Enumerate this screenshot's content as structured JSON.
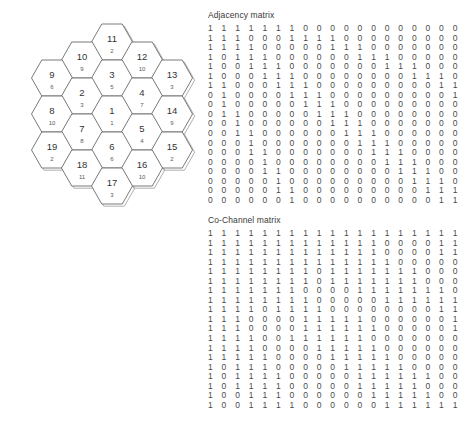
{
  "hex_map": {
    "name": "cellular-hexagon-cluster",
    "cells": [
      {
        "id": "11",
        "sub": "2",
        "cx": 112,
        "cy": 42
      },
      {
        "id": "10",
        "sub": "9",
        "cx": 82,
        "cy": 60
      },
      {
        "id": "12",
        "sub": "10",
        "cx": 142,
        "cy": 60
      },
      {
        "id": "9",
        "sub": "6",
        "cx": 52,
        "cy": 78
      },
      {
        "id": "3",
        "sub": "5",
        "cx": 112,
        "cy": 78
      },
      {
        "id": "13",
        "sub": "3",
        "cx": 172,
        "cy": 78
      },
      {
        "id": "2",
        "sub": "3",
        "cx": 82,
        "cy": 96
      },
      {
        "id": "4",
        "sub": "7",
        "cx": 142,
        "cy": 96
      },
      {
        "id": "8",
        "sub": "10",
        "cx": 52,
        "cy": 114
      },
      {
        "id": "1",
        "sub": "1",
        "cx": 112,
        "cy": 114
      },
      {
        "id": "14",
        "sub": "9",
        "cx": 172,
        "cy": 114
      },
      {
        "id": "7",
        "sub": "8",
        "cx": 82,
        "cy": 132
      },
      {
        "id": "5",
        "sub": "4",
        "cx": 142,
        "cy": 132
      },
      {
        "id": "19",
        "sub": "2",
        "cx": 52,
        "cy": 150
      },
      {
        "id": "6",
        "sub": "6",
        "cx": 112,
        "cy": 150
      },
      {
        "id": "15",
        "sub": "2",
        "cx": 172,
        "cy": 150
      },
      {
        "id": "18",
        "sub": "11",
        "cx": 82,
        "cy": 168
      },
      {
        "id": "16",
        "sub": "10",
        "cx": 142,
        "cy": 168
      },
      {
        "id": "17",
        "sub": "3",
        "cx": 112,
        "cy": 186
      }
    ]
  },
  "adjacency": {
    "title": "Adjacency matrix",
    "rows": [
      [
        1,
        1,
        1,
        1,
        1,
        1,
        1,
        0,
        0,
        0,
        0,
        0,
        0,
        0,
        0,
        0,
        0,
        0,
        0
      ],
      [
        1,
        1,
        1,
        0,
        0,
        0,
        1,
        1,
        1,
        1,
        0,
        0,
        0,
        0,
        0,
        0,
        0,
        0,
        0
      ],
      [
        1,
        1,
        1,
        1,
        0,
        0,
        0,
        0,
        0,
        1,
        1,
        1,
        0,
        0,
        0,
        0,
        0,
        0,
        0
      ],
      [
        1,
        0,
        1,
        1,
        1,
        0,
        0,
        0,
        0,
        0,
        0,
        1,
        1,
        1,
        0,
        0,
        0,
        0,
        0
      ],
      [
        1,
        0,
        0,
        1,
        1,
        1,
        0,
        0,
        0,
        0,
        0,
        0,
        0,
        1,
        1,
        1,
        0,
        0,
        0
      ],
      [
        1,
        0,
        0,
        0,
        1,
        1,
        1,
        0,
        0,
        0,
        0,
        0,
        0,
        0,
        0,
        1,
        1,
        1,
        0
      ],
      [
        1,
        1,
        0,
        0,
        0,
        1,
        1,
        1,
        0,
        0,
        0,
        0,
        0,
        0,
        0,
        0,
        0,
        1,
        1
      ],
      [
        0,
        1,
        0,
        0,
        0,
        0,
        1,
        1,
        1,
        0,
        0,
        0,
        0,
        0,
        0,
        0,
        0,
        0,
        1
      ],
      [
        0,
        1,
        0,
        0,
        0,
        0,
        0,
        1,
        1,
        1,
        0,
        0,
        0,
        0,
        0,
        0,
        0,
        0,
        0
      ],
      [
        0,
        1,
        1,
        0,
        0,
        0,
        0,
        0,
        1,
        1,
        1,
        0,
        0,
        0,
        0,
        0,
        0,
        0,
        0
      ],
      [
        0,
        0,
        1,
        0,
        0,
        0,
        0,
        0,
        0,
        1,
        1,
        1,
        0,
        0,
        0,
        0,
        0,
        0,
        0
      ],
      [
        0,
        0,
        1,
        1,
        0,
        0,
        0,
        0,
        0,
        0,
        1,
        1,
        1,
        0,
        0,
        0,
        0,
        0,
        0
      ],
      [
        0,
        0,
        0,
        1,
        0,
        0,
        0,
        0,
        0,
        0,
        0,
        1,
        1,
        1,
        0,
        0,
        0,
        0,
        0
      ],
      [
        0,
        0,
        0,
        1,
        1,
        0,
        0,
        0,
        0,
        0,
        0,
        0,
        1,
        1,
        1,
        0,
        0,
        0,
        0
      ],
      [
        0,
        0,
        0,
        0,
        1,
        0,
        0,
        0,
        0,
        0,
        0,
        0,
        0,
        1,
        1,
        1,
        0,
        0,
        0
      ],
      [
        0,
        0,
        0,
        0,
        1,
        1,
        0,
        0,
        0,
        0,
        0,
        0,
        0,
        0,
        1,
        1,
        1,
        0,
        0
      ],
      [
        0,
        0,
        0,
        0,
        0,
        1,
        0,
        0,
        0,
        0,
        0,
        0,
        0,
        0,
        0,
        1,
        1,
        1,
        0
      ],
      [
        0,
        0,
        0,
        0,
        0,
        1,
        1,
        0,
        0,
        0,
        0,
        0,
        0,
        0,
        0,
        0,
        1,
        1,
        1
      ],
      [
        0,
        0,
        0,
        0,
        0,
        0,
        1,
        0,
        0,
        0,
        0,
        0,
        0,
        0,
        0,
        0,
        0,
        1,
        1
      ]
    ]
  },
  "cochannel": {
    "title": "Co-Channel matrix",
    "rows": [
      [
        1,
        1,
        1,
        1,
        1,
        1,
        1,
        1,
        1,
        1,
        1,
        1,
        1,
        1,
        1,
        1,
        1,
        1,
        1
      ],
      [
        1,
        1,
        1,
        1,
        1,
        1,
        1,
        1,
        1,
        1,
        1,
        1,
        1,
        0,
        0,
        0,
        0,
        1,
        1
      ],
      [
        1,
        1,
        1,
        1,
        1,
        1,
        1,
        1,
        1,
        1,
        1,
        1,
        1,
        0,
        0,
        0,
        0,
        1,
        1
      ],
      [
        1,
        1,
        1,
        1,
        1,
        1,
        1,
        1,
        1,
        1,
        1,
        1,
        1,
        1,
        0,
        0,
        0,
        0,
        0
      ],
      [
        1,
        1,
        1,
        1,
        1,
        1,
        1,
        1,
        0,
        1,
        1,
        1,
        1,
        1,
        1,
        1,
        0,
        0,
        0
      ],
      [
        1,
        1,
        1,
        1,
        1,
        1,
        1,
        1,
        0,
        1,
        1,
        1,
        1,
        1,
        1,
        1,
        0,
        0,
        0
      ],
      [
        1,
        1,
        1,
        1,
        1,
        1,
        1,
        0,
        0,
        0,
        0,
        1,
        1,
        1,
        1,
        1,
        1,
        1,
        0
      ],
      [
        1,
        1,
        1,
        1,
        1,
        1,
        1,
        1,
        0,
        0,
        0,
        0,
        0,
        1,
        1,
        1,
        1,
        1,
        1
      ],
      [
        1,
        1,
        1,
        1,
        0,
        1,
        1,
        1,
        1,
        0,
        0,
        0,
        0,
        0,
        0,
        0,
        0,
        1,
        1
      ],
      [
        1,
        1,
        1,
        0,
        0,
        0,
        0,
        1,
        1,
        1,
        1,
        1,
        0,
        0,
        0,
        0,
        0,
        0,
        1
      ],
      [
        1,
        1,
        1,
        0,
        0,
        0,
        0,
        1,
        1,
        1,
        1,
        1,
        1,
        0,
        0,
        0,
        0,
        0,
        1
      ],
      [
        1,
        1,
        1,
        1,
        0,
        0,
        1,
        1,
        1,
        1,
        1,
        1,
        0,
        0,
        0,
        0,
        0,
        0,
        0
      ],
      [
        1,
        1,
        1,
        1,
        0,
        0,
        0,
        0,
        1,
        1,
        1,
        1,
        1,
        0,
        0,
        0,
        0,
        0,
        0
      ],
      [
        1,
        1,
        1,
        1,
        1,
        0,
        0,
        0,
        0,
        1,
        1,
        1,
        1,
        1,
        0,
        0,
        0,
        0,
        0
      ],
      [
        1,
        0,
        1,
        1,
        1,
        0,
        0,
        0,
        0,
        0,
        1,
        1,
        1,
        1,
        1,
        0,
        0,
        0,
        0
      ],
      [
        1,
        0,
        1,
        1,
        1,
        1,
        0,
        0,
        0,
        0,
        0,
        1,
        1,
        1,
        1,
        1,
        1,
        0,
        0
      ],
      [
        1,
        0,
        1,
        1,
        1,
        1,
        0,
        0,
        0,
        0,
        0,
        1,
        1,
        1,
        1,
        1,
        0,
        0,
        0
      ],
      [
        1,
        0,
        0,
        1,
        1,
        1,
        0,
        0,
        0,
        0,
        0,
        0,
        1,
        1,
        1,
        1,
        1,
        0,
        0
      ],
      [
        1,
        0,
        0,
        1,
        1,
        1,
        1,
        0,
        0,
        0,
        0,
        0,
        0,
        1,
        1,
        1,
        1,
        1,
        1
      ]
    ]
  }
}
